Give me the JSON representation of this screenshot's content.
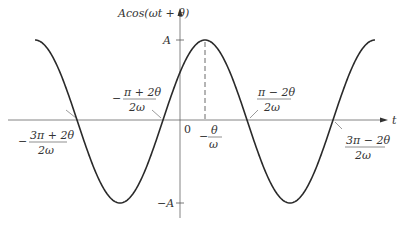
{
  "diagram": {
    "y_axis_label": "Acos(ωt + θ)",
    "x_axis_label": "t",
    "origin_label": "0",
    "amplitude_pos": "A",
    "amplitude_neg": "−A",
    "peak_label": {
      "sign": "−",
      "num": "θ",
      "den": "ω"
    },
    "crossings": [
      {
        "sign": "−",
        "num": "3π + 2θ",
        "den": "2ω"
      },
      {
        "sign": "−",
        "num": "π + 2θ",
        "den": "2ω"
      },
      {
        "sign": "",
        "num": "π − 2θ",
        "den": "2ω"
      },
      {
        "sign": "",
        "num": "3π − 2θ",
        "den": "2ω"
      }
    ],
    "colors": {
      "curve": "#2a2a2a",
      "axis": "#555555",
      "text": "#333333"
    }
  }
}
